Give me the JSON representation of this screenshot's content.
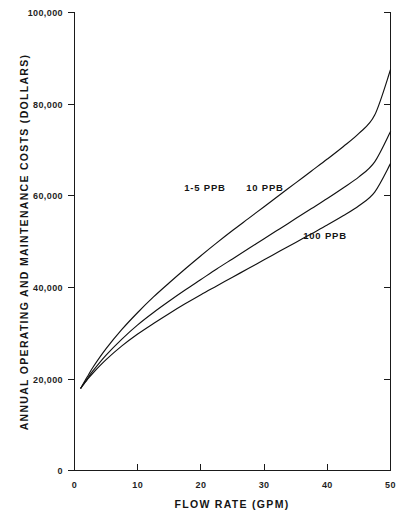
{
  "chart_data": {
    "type": "line",
    "title": "",
    "xlabel": "FLOW RATE (GPM)",
    "ylabel": "ANNUAL OPERATING AND MAINTENANCE COSTS (DOLLARS)",
    "xlim": [
      0,
      50
    ],
    "ylim": [
      0,
      100000
    ],
    "xticks": [
      0,
      10,
      20,
      30,
      40,
      50
    ],
    "yticks": [
      0,
      20000,
      40000,
      60000,
      80000,
      100000
    ],
    "xtick_labels": [
      "0",
      "10",
      "20",
      "30",
      "40",
      "50"
    ],
    "ytick_labels": [
      "0",
      "20,000",
      "40,000",
      "60,000",
      "80,000",
      "100,000"
    ],
    "grid": false,
    "legend_position": "inline-annotations",
    "x": [
      1,
      2,
      3,
      5,
      7.5,
      10,
      12.5,
      15,
      17.5,
      20,
      22.5,
      25,
      27.5,
      30,
      32.5,
      35,
      37.5,
      40,
      42.5,
      45,
      47.5,
      50
    ],
    "series": [
      {
        "name": "1-5 PPB",
        "label": "1-5 PPB",
        "values": [
          18000,
          20400,
          22700,
          26600,
          30800,
          34500,
          37900,
          41000,
          44000,
          46900,
          49700,
          52400,
          55000,
          57600,
          60200,
          62800,
          65400,
          68000,
          70700,
          73600,
          77600,
          87500
        ]
      },
      {
        "name": "10 PPB",
        "label": "10 PPB",
        "values": [
          18000,
          20000,
          21900,
          25200,
          28700,
          31800,
          34500,
          37000,
          39400,
          41700,
          44000,
          46200,
          48400,
          50600,
          52800,
          55000,
          57200,
          59400,
          61700,
          64100,
          67400,
          74000
        ]
      },
      {
        "name": "100 PPB",
        "label": "100 PPB",
        "values": [
          18000,
          19800,
          21400,
          24200,
          27200,
          29800,
          32100,
          34300,
          36400,
          38400,
          40300,
          42200,
          44100,
          46000,
          47900,
          49800,
          51700,
          53600,
          55600,
          57800,
          60800,
          67000
        ]
      }
    ],
    "annotations": [
      {
        "text": "1-5 PPB",
        "x": 20.5,
        "y": 58500
      },
      {
        "text": "10 PPB",
        "x": 28.5,
        "y": 58500
      },
      {
        "text": "100 PPB",
        "x": 35.5,
        "y": 48500
      }
    ]
  },
  "axes": {
    "y_title": "ANNUAL OPERATING AND MAINTENANCE COSTS (DOLLARS)",
    "x_title": "FLOW RATE (GPM)",
    "y_labels": {
      "t0": "0",
      "t1": "20,000",
      "t2": "40,000",
      "t3": "60,000",
      "t4": "80,000",
      "t5": "100,000"
    },
    "x_labels": {
      "t0": "0",
      "t1": "10",
      "t2": "20",
      "t3": "30",
      "t4": "40",
      "t5": "50"
    }
  },
  "series_labels": {
    "low": "1-5 PPB",
    "mid": "10 PPB",
    "high": "100 PPB"
  },
  "colors": {
    "ink": "#111111",
    "background": "#ffffff"
  }
}
